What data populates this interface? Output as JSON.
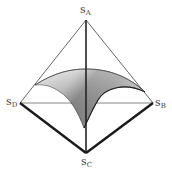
{
  "diagram": {
    "type": "tetrahedron-simplex",
    "vertices": {
      "A": {
        "label": "s",
        "subscript": "A",
        "x": 86,
        "y": 20
      },
      "B": {
        "label": "s",
        "subscript": "B",
        "x": 153,
        "y": 103
      },
      "C": {
        "label": "s",
        "subscript": "C",
        "x": 86,
        "y": 153
      },
      "D": {
        "label": "s",
        "subscript": "D",
        "x": 20,
        "y": 103
      }
    },
    "edges": [
      {
        "from": "A",
        "to": "D",
        "weight": "thin"
      },
      {
        "from": "A",
        "to": "B",
        "weight": "thin"
      },
      {
        "from": "D",
        "to": "B",
        "weight": "thin"
      },
      {
        "from": "A",
        "to": "C",
        "weight": "medium"
      },
      {
        "from": "D",
        "to": "C",
        "weight": "thick"
      },
      {
        "from": "B",
        "to": "C",
        "weight": "thick"
      }
    ],
    "surface": {
      "description": "curved shaded saddle surface inside tetrahedron",
      "left_tip": [
        35,
        85
      ],
      "right_tip": [
        145,
        92
      ],
      "top_apex": [
        86,
        70
      ],
      "bottom_point": [
        84,
        128
      ]
    },
    "colors": {
      "line": "#222222",
      "thin_line": "#555555",
      "surface_light": "#e8e8e8",
      "surface_dark": "#6e6e6e",
      "label": "#444444"
    }
  }
}
